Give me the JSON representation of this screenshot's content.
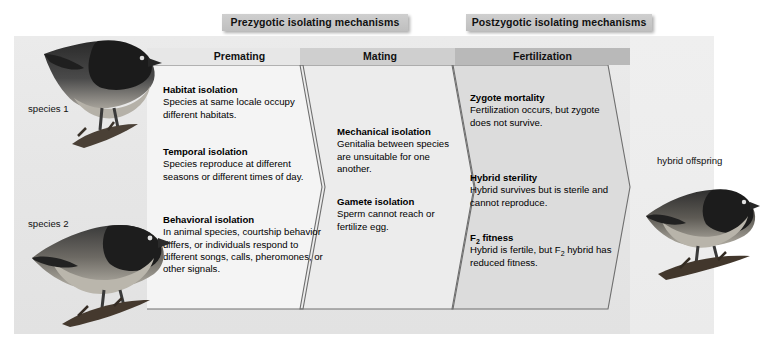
{
  "figure": {
    "banners": {
      "prezygotic": "Prezygotic isolating mechanisms",
      "postzygotic": "Postzygotic isolating mechanisms"
    },
    "stages": {
      "premating": "Premating",
      "mating": "Mating",
      "fertilization": "Fertilization"
    },
    "captions": {
      "species1": "species 1",
      "species2": "species 2",
      "hybrid": "hybrid offspring"
    },
    "mechanisms": {
      "habitat": {
        "title": "Habitat isolation",
        "text": "Species at same locale occupy different habitats."
      },
      "temporal": {
        "title": "Temporal isolation",
        "text": "Species reproduce at different seasons or different times of day."
      },
      "behavioral": {
        "title": "Behavioral isolation",
        "text": "In animal species, courtship behavior differs, or individuals respond to different songs, calls, pheromones, or other signals."
      },
      "mechanical": {
        "title": "Mechanical isolation",
        "text": "Genitalia between species are unsuitable for one another."
      },
      "gamete": {
        "title": "Gamete isolation",
        "text": "Sperm cannot reach or fertilize egg."
      },
      "zygote": {
        "title": "Zygote mortality",
        "text": "Fertilization occurs, but zygote does not survive."
      },
      "hybrid_sterility": {
        "title": "Hybrid sterility",
        "text": "Hybrid survives but is sterile and cannot reproduce."
      },
      "f2_fitness": {
        "title_pre": "F",
        "title_sub": "2",
        "title_post": " fitness",
        "text_pre": "Hybrid is fertile, but F",
        "text_sub": "2",
        "text_post": " hybrid has reduced fitness."
      }
    },
    "colors": {
      "banner_fill": "#c5c5c5",
      "stage_premating": "#e7e7e7",
      "stage_mating": "#cfcfcf",
      "stage_fertilization": "#b9b9b9",
      "chevron_outline": "#6e6e6e",
      "backdrop": "#e8e8e8",
      "text": "#000000"
    }
  }
}
